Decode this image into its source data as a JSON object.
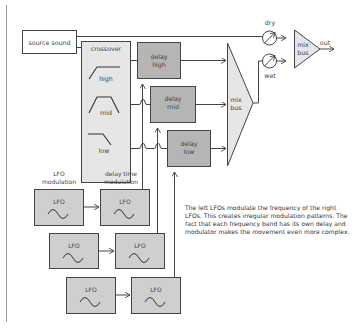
{
  "diagram": {
    "source": {
      "label": "source sound"
    },
    "crossover": {
      "title": "crossover",
      "bands": [
        {
          "label": "high",
          "filter_shape": "high-pass"
        },
        {
          "label": "mid",
          "filter_shape": "band-pass"
        },
        {
          "label": "low",
          "filter_shape": "low-pass"
        }
      ]
    },
    "delays": [
      {
        "line1": "delay",
        "line2": "high"
      },
      {
        "line1": "delay",
        "line2": "mid"
      },
      {
        "line1": "delay",
        "line2": "low"
      }
    ],
    "mix_bus_wet": {
      "line1": "mix",
      "line2": "bus"
    },
    "knobs": {
      "dry": "dry",
      "wet": "wet"
    },
    "mix_bus_out": {
      "line1": "mix",
      "line2": "bus"
    },
    "output": {
      "label": "out"
    },
    "lfo_headers": {
      "left_line1": "LFO",
      "left_line2": "modulation",
      "right_line1": "delay time",
      "right_line2": "modulation"
    },
    "lfo_label": "LFO",
    "lfo_rows": 3,
    "note": "The left LFOs modulate the frequency of the right LFOs. This creates irregular modulation patterns. The fact that each frequency band has its own delay and modulator makes the movement even more complex.",
    "colors": {
      "line": "#444444",
      "box_light": "#e6e6e6",
      "box_dark": "#b5b5b5",
      "lfo_box": "#cfcfcf",
      "margin_rule": "#9a9a9a"
    }
  }
}
